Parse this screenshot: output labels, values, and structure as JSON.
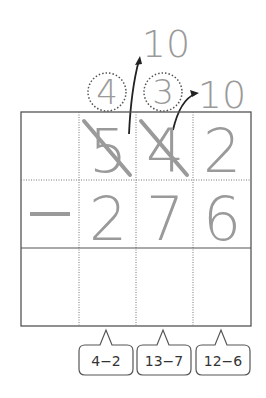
{
  "problem": {
    "minuend": [
      "5",
      "4",
      "2"
    ],
    "subtrahend": [
      "2",
      "7",
      "6"
    ],
    "operator": "—"
  },
  "borrow": {
    "circled": [
      "4",
      "3"
    ],
    "tens": [
      "10",
      "10"
    ]
  },
  "callouts": [
    "4−2",
    "13−7",
    "12−6"
  ],
  "colors": {
    "digit": "#9a9a9a",
    "grid": "#555555",
    "arrow": "#222222",
    "callout_border": "#555555"
  }
}
